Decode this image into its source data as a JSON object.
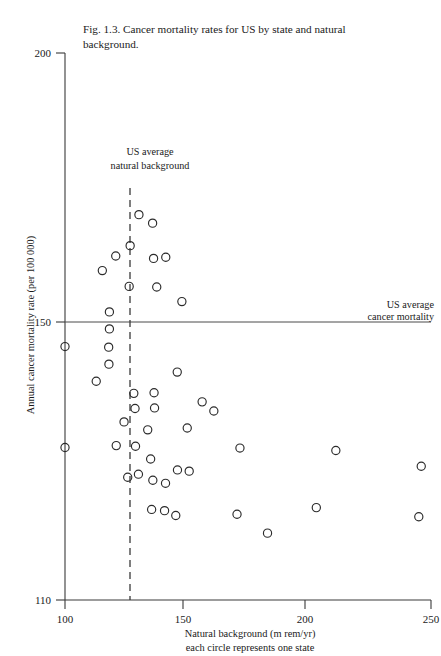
{
  "figure": {
    "caption": "Fig. 1.3. Cancer mortality rates for US by state and natural background."
  },
  "annotations": {
    "us_avg_background_line1": "US average",
    "us_avg_background_line2": "natural background",
    "us_avg_mortality_line1": "US average",
    "us_avg_mortality_line2": "cancer mortality"
  },
  "chart_data": {
    "type": "scatter",
    "title": "Fig. 1.3. Cancer mortality rates for US by state and natural background.",
    "xlabel": "Natural background (m rem/yr)",
    "xlabel_sub": "each circle represents one state",
    "ylabel": "Annual cancer mortality rate (per 100 000)",
    "xlim": [
      100,
      250
    ],
    "ylim": [
      110,
      200
    ],
    "xticks": [
      100,
      150,
      200,
      250
    ],
    "xtick_labels": [
      "100",
      "150",
      "200",
      "250"
    ],
    "yticks": [
      110,
      150,
      200
    ],
    "ytick_labels": [
      "110",
      "150",
      "200"
    ],
    "grid": false,
    "legend": false,
    "marker": "open-circle",
    "reference_lines": [
      {
        "name": "us-average-natural-background",
        "orientation": "vertical",
        "value": 127,
        "style": "dashed",
        "label": "US average natural background"
      },
      {
        "name": "us-average-cancer-mortality",
        "orientation": "horizontal",
        "value": 150,
        "style": "solid",
        "label": "US average cancer mortality"
      }
    ],
    "points": [
      {
        "x": 100.0,
        "y": 151.7
      },
      {
        "x": 100.0,
        "y": 135.1
      },
      {
        "x": 115.3,
        "y": 164.2
      },
      {
        "x": 120.8,
        "y": 166.6
      },
      {
        "x": 126.7,
        "y": 168.3
      },
      {
        "x": 130.3,
        "y": 173.4
      },
      {
        "x": 135.9,
        "y": 172.0
      },
      {
        "x": 118.2,
        "y": 157.4
      },
      {
        "x": 118.2,
        "y": 154.6
      },
      {
        "x": 126.3,
        "y": 161.6
      },
      {
        "x": 136.3,
        "y": 166.2
      },
      {
        "x": 141.3,
        "y": 166.4
      },
      {
        "x": 137.6,
        "y": 161.5
      },
      {
        "x": 147.9,
        "y": 159.1
      },
      {
        "x": 117.9,
        "y": 151.6
      },
      {
        "x": 118.0,
        "y": 148.8
      },
      {
        "x": 112.8,
        "y": 146.0
      },
      {
        "x": 128.2,
        "y": 144.0
      },
      {
        "x": 146.0,
        "y": 147.5
      },
      {
        "x": 128.7,
        "y": 141.5
      },
      {
        "x": 136.7,
        "y": 141.6
      },
      {
        "x": 136.5,
        "y": 144.1
      },
      {
        "x": 156.2,
        "y": 142.6
      },
      {
        "x": 161.0,
        "y": 141.1
      },
      {
        "x": 124.2,
        "y": 139.3
      },
      {
        "x": 133.9,
        "y": 138.0
      },
      {
        "x": 150.1,
        "y": 138.3
      },
      {
        "x": 121.0,
        "y": 135.4
      },
      {
        "x": 128.9,
        "y": 135.3
      },
      {
        "x": 135.1,
        "y": 133.2
      },
      {
        "x": 171.7,
        "y": 135.0
      },
      {
        "x": 211.0,
        "y": 134.6
      },
      {
        "x": 246.0,
        "y": 132.0
      },
      {
        "x": 150.9,
        "y": 131.2
      },
      {
        "x": 125.7,
        "y": 130.2
      },
      {
        "x": 130.1,
        "y": 130.7
      },
      {
        "x": 136.0,
        "y": 129.7
      },
      {
        "x": 141.2,
        "y": 129.2
      },
      {
        "x": 146.1,
        "y": 131.4
      },
      {
        "x": 135.5,
        "y": 124.9
      },
      {
        "x": 140.8,
        "y": 124.7
      },
      {
        "x": 145.4,
        "y": 123.9
      },
      {
        "x": 170.5,
        "y": 124.1
      },
      {
        "x": 203.0,
        "y": 125.2
      },
      {
        "x": 245.0,
        "y": 123.7
      },
      {
        "x": 183.0,
        "y": 121.0
      }
    ]
  }
}
